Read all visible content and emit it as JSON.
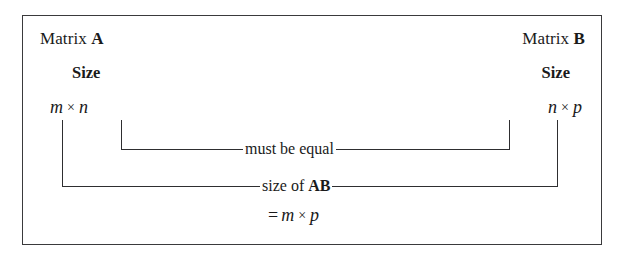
{
  "figure": {
    "title_hidden": "",
    "background_color": "#ffffff",
    "border_color": "#3a3a3c",
    "line_color": "#2e2e30"
  },
  "left_matrix": {
    "header_prefix": "Matrix",
    "header_name": "A",
    "size_label": "Size",
    "dim_rows": "m",
    "dim_times": "×",
    "dim_cols": "n"
  },
  "right_matrix": {
    "header_prefix": "Matrix",
    "header_name": "B",
    "size_label": "Size",
    "dim_rows": "n",
    "dim_times": "×",
    "dim_cols": "p"
  },
  "inner_bracket": {
    "label": "must be equal"
  },
  "outer_bracket": {
    "label_prefix": "size of",
    "label_name": "AB"
  },
  "result": {
    "equals": "=",
    "rows": "m",
    "times": "×",
    "cols": "p"
  }
}
